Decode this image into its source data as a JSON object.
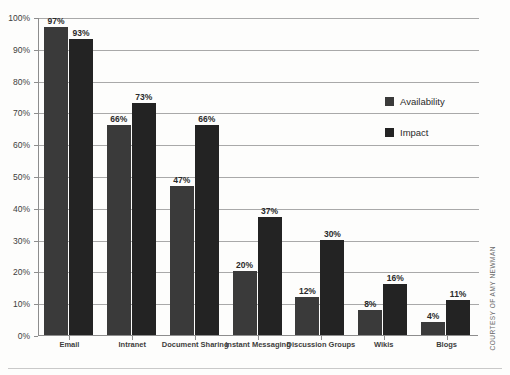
{
  "chart_data": {
    "type": "bar",
    "title": "",
    "xlabel": "",
    "ylabel": "",
    "ylim": [
      0,
      100
    ],
    "ytick_labels": [
      "100%",
      "90%",
      "80%",
      "70%",
      "60%",
      "50%",
      "40%",
      "30%",
      "20%",
      "10%",
      "0%"
    ],
    "ytick_values": [
      100,
      90,
      80,
      70,
      60,
      50,
      40,
      30,
      20,
      10,
      0
    ],
    "grid": true,
    "legend_position": "right",
    "categories": [
      "Email",
      "Intranet",
      "Document Sharing",
      "Instant Messaging",
      "Discussion Groups",
      "Wikis",
      "Blogs"
    ],
    "series": [
      {
        "name": "Availability",
        "color": "#3a3a3a",
        "values": [
          97,
          66,
          47,
          20,
          12,
          8,
          4
        ],
        "labels": [
          "97%",
          "66%",
          "47%",
          "20%",
          "12%",
          "8%",
          "4%"
        ]
      },
      {
        "name": "Impact",
        "color": "#232323",
        "values": [
          93,
          73,
          66,
          37,
          30,
          16,
          11
        ],
        "labels": [
          "93%",
          "73%",
          "66%",
          "37%",
          "30%",
          "16%",
          "11%"
        ]
      }
    ]
  },
  "legend": {
    "items": [
      {
        "label": "Availability",
        "color": "#3a3a3a"
      },
      {
        "label": "Impact",
        "color": "#232323"
      }
    ]
  },
  "credit": "COURTESY OF AMY NEWMAN"
}
